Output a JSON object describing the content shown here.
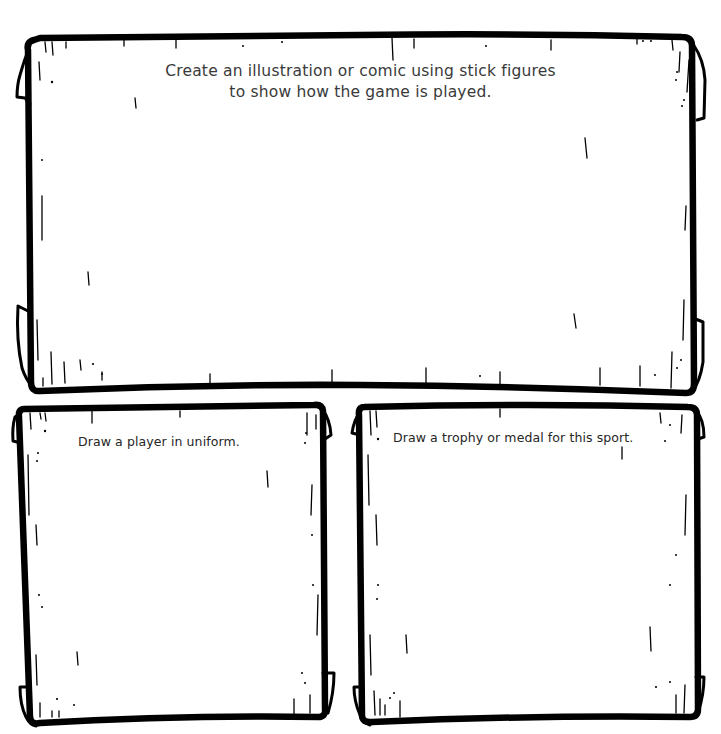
{
  "worksheet": {
    "colors": {
      "ink": "#000000",
      "text": "#2b2b2b",
      "paper": "#ffffff"
    },
    "panels": [
      {
        "id": "stick-figure-comic",
        "prompt_lines": [
          "Create an illustration or comic using stick figures",
          "to show how the game is played."
        ]
      },
      {
        "id": "player-uniform",
        "prompt": "Draw a player in uniform."
      },
      {
        "id": "trophy-medal",
        "prompt": "Draw a trophy or medal for this sport."
      }
    ]
  }
}
